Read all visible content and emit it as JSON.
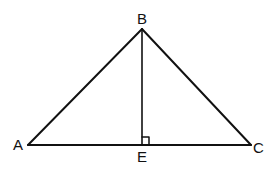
{
  "diagram": {
    "type": "geometry",
    "points": {
      "A": {
        "label": "A",
        "x": 28,
        "y": 145
      },
      "B": {
        "label": "B",
        "x": 142,
        "y": 29
      },
      "C": {
        "label": "C",
        "x": 251,
        "y": 145
      },
      "E": {
        "label": "E",
        "x": 142,
        "y": 145
      }
    },
    "segments": [
      {
        "from": "A",
        "to": "B"
      },
      {
        "from": "B",
        "to": "C"
      },
      {
        "from": "A",
        "to": "C"
      },
      {
        "from": "B",
        "to": "E"
      }
    ],
    "right_angle_at": "E",
    "stroke_color": "#111111"
  }
}
